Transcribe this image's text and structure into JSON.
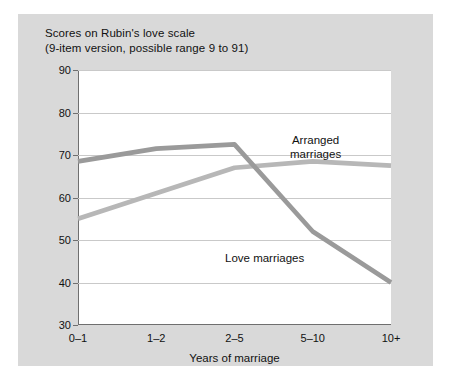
{
  "figure": {
    "title_line_1": "Scores on Rubin's love scale",
    "title_line_2": "(9-item version, possible range 9 to 91)",
    "panel_color": "#d9d9d9",
    "plot_background": "#ffffff"
  },
  "chart_data": {
    "type": "line",
    "title": "Scores on Rubin's love scale (9-item version, possible range 9 to 91)",
    "categories": [
      "0–1",
      "1–2",
      "2–5",
      "5–10",
      "10+"
    ],
    "xlabel": "Years of marriage",
    "ylabel": "",
    "ylim": [
      30,
      90
    ],
    "yticks": [
      30,
      40,
      50,
      60,
      70,
      80,
      90
    ],
    "grid": true,
    "legend_position": "inline-annotations",
    "series": [
      {
        "name": "Arranged marriages",
        "values": [
          55,
          61,
          67,
          68.5,
          67.5
        ],
        "color": "#b7b7b7",
        "annotation": "Arranged\nmarriages"
      },
      {
        "name": "Love marriages",
        "values": [
          68.5,
          71.5,
          72.5,
          52,
          40
        ],
        "color": "#9a9a9a",
        "annotation": "Love marriages"
      }
    ]
  },
  "axes": {
    "y_tick_labels": [
      "90",
      "80",
      "70",
      "60",
      "50",
      "40",
      "30"
    ],
    "x_tick_labels": [
      "0–1",
      "1–2",
      "2–5",
      "5–10",
      "10+"
    ],
    "x_axis_title": "Years of marriage"
  },
  "annotations": {
    "arranged_line_1": "Arranged",
    "arranged_line_2": "marriages",
    "love": "Love marriages"
  }
}
